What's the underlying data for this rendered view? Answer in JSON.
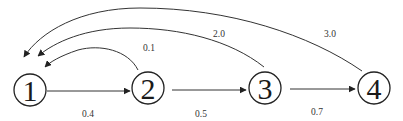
{
  "diagram": {
    "type": "directed-graph",
    "nodes": [
      {
        "id": "1",
        "label": "1",
        "cx": 30,
        "cy": 90
      },
      {
        "id": "2",
        "label": "2",
        "cx": 148,
        "cy": 88
      },
      {
        "id": "3",
        "label": "3",
        "cx": 265,
        "cy": 88
      },
      {
        "id": "4",
        "label": "4",
        "cx": 375,
        "cy": 88
      }
    ],
    "edges": [
      {
        "from": "1",
        "to": "2",
        "weight": "0.4"
      },
      {
        "from": "2",
        "to": "3",
        "weight": "0.5"
      },
      {
        "from": "3",
        "to": "4",
        "weight": "0.7"
      },
      {
        "from": "2",
        "to": "1",
        "weight": "0.1"
      },
      {
        "from": "3",
        "to": "1",
        "weight": "2.0"
      },
      {
        "from": "4",
        "to": "1",
        "weight": "3.0"
      }
    ],
    "colors": {
      "stroke": "#333333",
      "background": "#ffffff"
    }
  }
}
